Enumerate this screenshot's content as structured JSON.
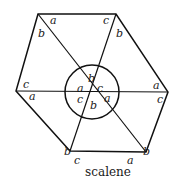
{
  "diagram": {
    "caption": "scalene",
    "stroke_color": "#111111",
    "vertices": {
      "top_left": [
        38,
        14
      ],
      "top_right": [
        116,
        14
      ],
      "right": [
        168,
        92
      ],
      "bottom_right": [
        146,
        152
      ],
      "bottom_left": [
        70,
        151
      ],
      "left": [
        16,
        91
      ],
      "center": [
        92,
        92
      ]
    },
    "circle_radius": 27,
    "outer_labels": [
      {
        "text": "a",
        "x": 50,
        "y": 24
      },
      {
        "text": "b",
        "x": 38,
        "y": 37
      },
      {
        "text": "c",
        "x": 103,
        "y": 24
      },
      {
        "text": "b",
        "x": 116,
        "y": 37
      },
      {
        "text": "c",
        "x": 23,
        "y": 88
      },
      {
        "text": "a",
        "x": 29,
        "y": 100
      },
      {
        "text": "a",
        "x": 153,
        "y": 89
      },
      {
        "text": "c",
        "x": 157,
        "y": 103
      },
      {
        "text": "b",
        "x": 64,
        "y": 155
      },
      {
        "text": "c",
        "x": 74,
        "y": 164
      },
      {
        "text": "a",
        "x": 127,
        "y": 164
      },
      {
        "text": "b",
        "x": 143,
        "y": 155
      }
    ],
    "inner_labels": [
      {
        "text": "b",
        "x": 88,
        "y": 80
      },
      {
        "text": "a",
        "x": 78,
        "y": 91
      },
      {
        "text": "c",
        "x": 96,
        "y": 91
      },
      {
        "text": "c",
        "x": 78,
        "y": 103
      },
      {
        "text": "a",
        "x": 104,
        "y": 100
      },
      {
        "text": "b",
        "x": 91,
        "y": 108
      }
    ]
  }
}
